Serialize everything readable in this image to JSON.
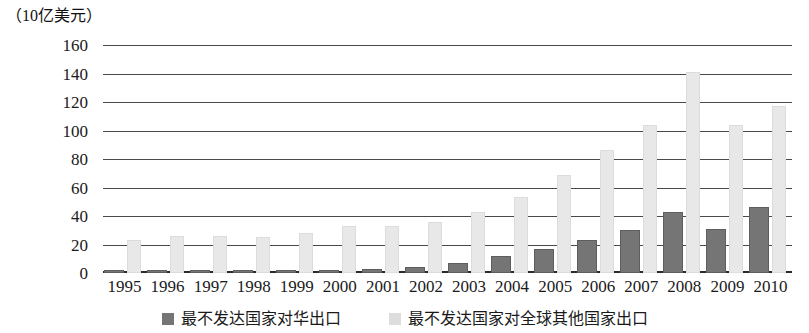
{
  "chart": {
    "unit_label": "（10亿美元）",
    "y_ticks": [
      "160",
      "140",
      "120",
      "100",
      "80",
      "60",
      "40",
      "20",
      "0"
    ],
    "legend": [
      {
        "label": "最不发达国家对华出口",
        "color": "#757575",
        "swatch": "dark"
      },
      {
        "label": "最不发达国家对全球其他国家出口",
        "color": "#dddddd",
        "swatch": "light"
      }
    ]
  },
  "chart_data": {
    "type": "bar",
    "title": "",
    "subtitle": "",
    "xlabel": "",
    "ylabel": "（10亿美元）",
    "ylim": [
      0,
      160
    ],
    "ytick_step": 20,
    "grid": true,
    "legend_position": "bottom",
    "categories": [
      "1995",
      "1996",
      "1997",
      "1998",
      "1999",
      "2000",
      "2001",
      "2002",
      "2003",
      "2004",
      "2005",
      "2006",
      "2007",
      "2008",
      "2009",
      "2010"
    ],
    "series": [
      {
        "name": "最不发达国家对华出口",
        "color": "#757575",
        "values": [
          2,
          2,
          2,
          2,
          2,
          2,
          3,
          4,
          7,
          12,
          17,
          23,
          30,
          43,
          31,
          46
        ]
      },
      {
        "name": "最不发达国家对全球其他国家出口",
        "color": "#e8e8e8",
        "values": [
          23,
          26,
          26,
          25,
          28,
          33,
          33,
          36,
          43,
          53,
          69,
          86,
          104,
          141,
          104,
          117
        ]
      }
    ]
  }
}
